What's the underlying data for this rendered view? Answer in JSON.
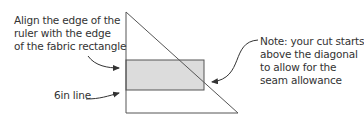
{
  "labels": {
    "align": "Align the edge of the\nruler with the edge\nof the fabric rectangle",
    "six_in": "6in line",
    "note": "Note: your cut starts\nabove the diagonal\nto allow for the\nseam allowance"
  },
  "colors": {
    "stroke": "#555555",
    "fill": "#dcdcdc",
    "text": "#333333"
  }
}
